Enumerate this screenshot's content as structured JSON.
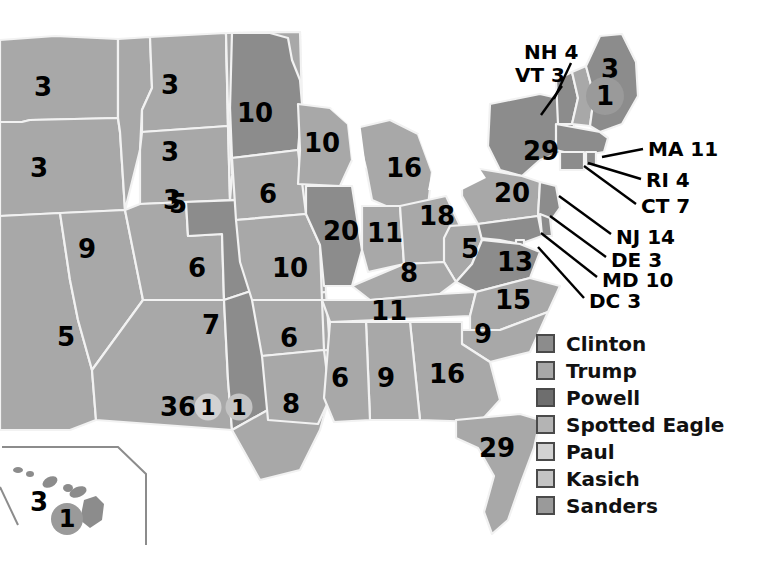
{
  "colors": {
    "background": "#ffffff",
    "clinton": "#8c8c8c",
    "trump": "#a8a8a8",
    "powell": "#6e6e6e",
    "spotted_eagle": "#b4b4b4",
    "paul": "#d2d2d2",
    "kasich": "#c4c4c4",
    "sanders": "#9a9a9a",
    "border": "#f2f2f2",
    "inset_border": "#8c8c8c",
    "label_text": "#000000",
    "callout_line": "#000000"
  },
  "legend": {
    "items": [
      {
        "label": "Clinton",
        "swatch": "#8c8c8c"
      },
      {
        "label": "Trump",
        "swatch": "#a8a8a8"
      },
      {
        "label": "Powell",
        "swatch": "#6e6e6e"
      },
      {
        "label": "Spotted Eagle",
        "swatch": "#b4b4b4"
      },
      {
        "label": "Paul",
        "swatch": "#d2d2d2"
      },
      {
        "label": "Kasich",
        "swatch": "#c4c4c4"
      },
      {
        "label": "Sanders",
        "swatch": "#9a9a9a"
      }
    ]
  },
  "map": {
    "state_labels": [
      {
        "name": "washington",
        "value": "3",
        "x": 43,
        "y": 87,
        "size": 26
      },
      {
        "name": "montana",
        "value": "3",
        "x": 170,
        "y": 85,
        "size": 26
      },
      {
        "name": "oregon",
        "value": "3",
        "x": 39,
        "y": 168,
        "size": 26
      },
      {
        "name": "north-dakota",
        "value": "3",
        "x": 170,
        "y": 152,
        "size": 26
      },
      {
        "name": "minnesota",
        "value": "10",
        "x": 255,
        "y": 113,
        "size": 26
      },
      {
        "name": "wisconsin",
        "value": "10",
        "x": 322,
        "y": 143,
        "size": 26
      },
      {
        "name": "michigan",
        "value": "16",
        "x": 404,
        "y": 168,
        "size": 26
      },
      {
        "name": "south-dakota",
        "value": "3",
        "x": 172,
        "y": 200,
        "size": 26
      },
      {
        "name": "iowa",
        "value": "6",
        "x": 268,
        "y": 194,
        "size": 26
      },
      {
        "name": "nebraska",
        "value": "5",
        "x": 178,
        "y": 204,
        "size": 26
      },
      {
        "name": "new-york",
        "value": "29",
        "x": 541,
        "y": 151,
        "size": 26
      },
      {
        "name": "pennsylvania",
        "value": "20",
        "x": 512,
        "y": 193,
        "size": 26
      },
      {
        "name": "illinois",
        "value": "20",
        "x": 341,
        "y": 231,
        "size": 26
      },
      {
        "name": "indiana",
        "value": "11",
        "x": 385,
        "y": 233,
        "size": 26
      },
      {
        "name": "ohio",
        "value": "18",
        "x": 437,
        "y": 216,
        "size": 26
      },
      {
        "name": "west-virginia",
        "value": "5",
        "x": 470,
        "y": 249,
        "size": 26
      },
      {
        "name": "virginia",
        "value": "13",
        "x": 515,
        "y": 262,
        "size": 26
      },
      {
        "name": "colorado",
        "value": "9",
        "x": 87,
        "y": 249,
        "size": 26
      },
      {
        "name": "kansas",
        "value": "6",
        "x": 197,
        "y": 268,
        "size": 26
      },
      {
        "name": "missouri",
        "value": "10",
        "x": 290,
        "y": 268,
        "size": 26
      },
      {
        "name": "kentucky",
        "value": "8",
        "x": 409,
        "y": 273,
        "size": 26
      },
      {
        "name": "tennessee",
        "value": "11",
        "x": 389,
        "y": 311,
        "size": 26
      },
      {
        "name": "north-carolina",
        "value": "15",
        "x": 513,
        "y": 300,
        "size": 26
      },
      {
        "name": "south-carolina",
        "value": "9",
        "x": 483,
        "y": 334,
        "size": 26
      },
      {
        "name": "new-mexico",
        "value": "5",
        "x": 66,
        "y": 337,
        "size": 26
      },
      {
        "name": "oklahoma",
        "value": "7",
        "x": 211,
        "y": 325,
        "size": 26
      },
      {
        "name": "arkansas",
        "value": "6",
        "x": 289,
        "y": 338,
        "size": 26
      },
      {
        "name": "louisiana",
        "value": "8",
        "x": 291,
        "y": 404,
        "size": 26
      },
      {
        "name": "mississippi",
        "value": "6",
        "x": 340,
        "y": 378,
        "size": 26
      },
      {
        "name": "alabama",
        "value": "9",
        "x": 386,
        "y": 378,
        "size": 26
      },
      {
        "name": "georgia",
        "value": "16",
        "x": 447,
        "y": 374,
        "size": 26
      },
      {
        "name": "florida",
        "value": "29",
        "x": 497,
        "y": 448,
        "size": 26
      },
      {
        "name": "texas",
        "value": "36",
        "x": 178,
        "y": 407,
        "size": 26
      },
      {
        "name": "maine",
        "value": "3",
        "x": 610,
        "y": 69,
        "size": 26
      },
      {
        "name": "hawaii",
        "value": "3",
        "x": 39,
        "y": 502,
        "size": 26
      }
    ],
    "split_badges": [
      {
        "name": "maine-split-vote",
        "value": "1",
        "x": 605,
        "y": 96,
        "size": 38,
        "fill": "#9a9a9a",
        "font": 26
      },
      {
        "name": "texas-split-vote-1",
        "value": "1",
        "x": 208,
        "y": 407,
        "size": 27,
        "fill": "#d2d2d2",
        "font": 22
      },
      {
        "name": "texas-split-vote-2",
        "value": "1",
        "x": 239,
        "y": 407,
        "size": 27,
        "fill": "#c4c4c4",
        "font": 22
      },
      {
        "name": "hawaii-split-vote",
        "value": "1",
        "x": 67,
        "y": 519,
        "size": 32,
        "fill": "#9a9a9a",
        "font": 24
      }
    ],
    "callouts": [
      {
        "name": "new-hampshire",
        "label": "NH 4",
        "tx": 524,
        "ty": 42,
        "size": 20,
        "x1": 571,
        "y1": 63,
        "x2": 554,
        "y2": 99
      },
      {
        "name": "vermont",
        "label": "VT 3",
        "tx": 515,
        "ty": 65,
        "size": 20,
        "x1": 562,
        "y1": 86,
        "x2": 541,
        "y2": 115
      },
      {
        "name": "massachusetts",
        "label": "MA 11",
        "tx": 648,
        "ty": 139,
        "size": 20,
        "x1": 643,
        "y1": 149,
        "x2": 602,
        "y2": 157
      },
      {
        "name": "rhode-island",
        "label": "RI 4",
        "tx": 646,
        "ty": 170,
        "size": 20,
        "x1": 641,
        "y1": 179,
        "x2": 588,
        "y2": 163
      },
      {
        "name": "connecticut",
        "label": "CT 7",
        "tx": 641,
        "ty": 196,
        "size": 20,
        "x1": 636,
        "y1": 204,
        "x2": 584,
        "y2": 166
      },
      {
        "name": "new-jersey",
        "label": "NJ 14",
        "tx": 616,
        "ty": 227,
        "size": 20,
        "x1": 611,
        "y1": 234,
        "x2": 559,
        "y2": 196
      },
      {
        "name": "delaware",
        "label": "DE 3",
        "tx": 611,
        "ty": 250,
        "size": 20,
        "x1": 606,
        "y1": 257,
        "x2": 550,
        "y2": 216
      },
      {
        "name": "maryland",
        "label": "MD 10",
        "tx": 602,
        "ty": 270,
        "size": 20,
        "x1": 597,
        "y1": 277,
        "x2": 541,
        "y2": 233
      },
      {
        "name": "dc",
        "label": "DC 3",
        "tx": 589,
        "ty": 291,
        "size": 20,
        "x1": 584,
        "y1": 298,
        "x2": 538,
        "y2": 247
      }
    ]
  }
}
